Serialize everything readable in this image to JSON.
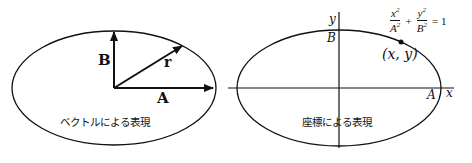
{
  "left_diagram": {
    "label_B": "B",
    "label_r": "r",
    "label_A": "A",
    "caption": "ベクトルによる表現"
  },
  "right_diagram": {
    "axis_y": "y",
    "axis_x": "x",
    "label_B": "B",
    "label_A": "A",
    "point": "(x, y)",
    "equation": {
      "term1_num": "x",
      "term1_den": "A",
      "plus": "+",
      "term2_num": "y",
      "term2_den": "B",
      "equals": "= 1",
      "exponent": "2"
    },
    "caption": "座標による表現"
  },
  "colors": {
    "stroke": "#111111",
    "background": "#ffffff"
  }
}
